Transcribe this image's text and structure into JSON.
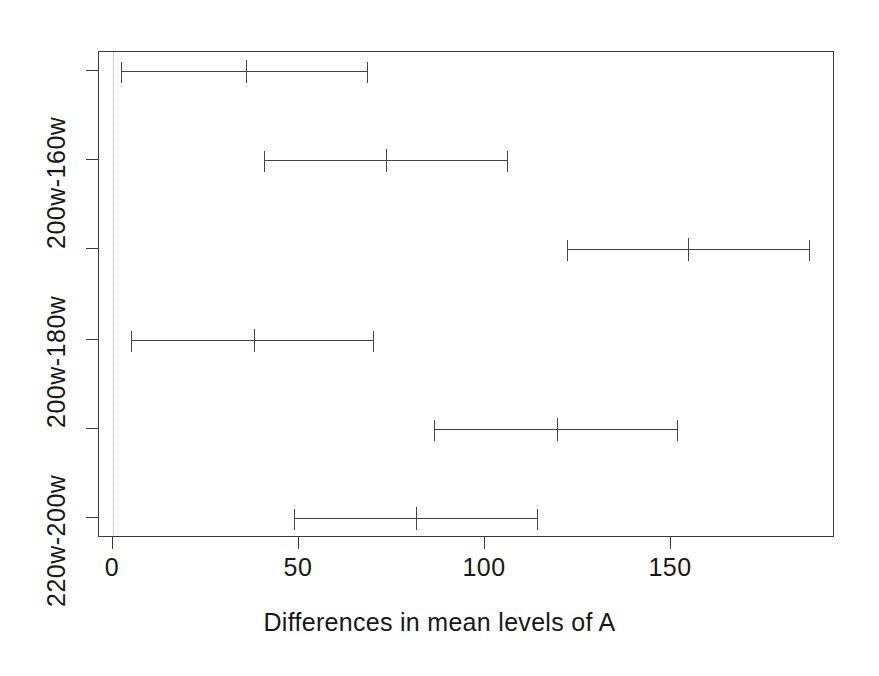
{
  "chart_data": {
    "type": "line",
    "plot_kind": "confidence-interval-dotplot",
    "title": "",
    "subtitle": "",
    "xlabel": "Differences in mean levels of A",
    "ylabel": "",
    "xlim": [
      -3,
      195
    ],
    "xticks": [
      0,
      50,
      100,
      150
    ],
    "xtick_labels": [
      "0",
      "50",
      "100",
      "150"
    ],
    "grid": false,
    "legend": null,
    "reference_line": {
      "x": 0,
      "style": "dotted",
      "color": "#b9b9b9"
    },
    "ytick_labels_visible": [
      "200w-160w",
      "200w-180w",
      "220w-200w"
    ],
    "categories": [
      "200w-160w",
      "200w-180w",
      "200w-160w",
      "200w-180w",
      "220w-200w",
      "220w-200w"
    ],
    "intervals": [
      {
        "index": 1,
        "lower": 2.2,
        "center": 35.8,
        "upper": 68.5
      },
      {
        "index": 2,
        "lower": 40.6,
        "center": 73.4,
        "upper": 106.2
      },
      {
        "index": 3,
        "lower": 122.0,
        "center": 154.6,
        "upper": 187.4
      },
      {
        "index": 4,
        "lower": 4.8,
        "center": 37.9,
        "upper": 70.2
      },
      {
        "index": 5,
        "lower": 86.3,
        "center": 119.4,
        "upper": 151.9
      },
      {
        "index": 6,
        "lower": 48.7,
        "center": 81.5,
        "upper": 114.2
      }
    ]
  },
  "axis": {
    "x_title": "Differences in mean levels of A",
    "x_tick_labels": [
      "0",
      "50",
      "100",
      "150"
    ],
    "y_tick_labels": [
      "200w-160w",
      "200w-180w",
      "220w-200w"
    ]
  },
  "colors": {
    "line": "#444444",
    "axis": "#3a3a3a",
    "reference": "#b9b9b9",
    "text": "#171717",
    "background": "#ffffff"
  }
}
